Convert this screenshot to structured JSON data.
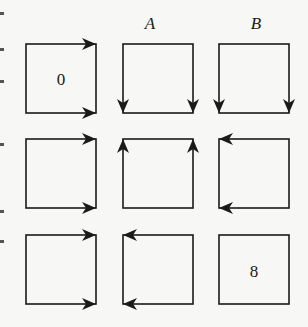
{
  "column_labels": [
    "",
    "A",
    "B"
  ],
  "stroke_color": "#1a1a1a",
  "background_color": "#f7f7f5",
  "grid": {
    "rows": 3,
    "cols": 3,
    "cells": [
      {
        "row": 0,
        "col": 0,
        "label": "0",
        "arrows": [
          {
            "corner": "top-right",
            "direction": "right"
          },
          {
            "corner": "bottom-right",
            "direction": "right"
          }
        ]
      },
      {
        "row": 0,
        "col": 1,
        "label": "",
        "arrows": [
          {
            "corner": "bottom-left",
            "direction": "down"
          },
          {
            "corner": "bottom-right",
            "direction": "down"
          }
        ]
      },
      {
        "row": 0,
        "col": 2,
        "label": "",
        "arrows": [
          {
            "corner": "bottom-left",
            "direction": "down"
          },
          {
            "corner": "bottom-right",
            "direction": "down"
          }
        ]
      },
      {
        "row": 1,
        "col": 0,
        "label": "",
        "arrows": [
          {
            "corner": "top-right",
            "direction": "right"
          },
          {
            "corner": "bottom-right",
            "direction": "right"
          }
        ]
      },
      {
        "row": 1,
        "col": 1,
        "label": "",
        "arrows": [
          {
            "corner": "top-left",
            "direction": "up"
          },
          {
            "corner": "top-right",
            "direction": "up"
          }
        ]
      },
      {
        "row": 1,
        "col": 2,
        "label": "",
        "arrows": [
          {
            "corner": "top-left",
            "direction": "left"
          },
          {
            "corner": "bottom-left",
            "direction": "left"
          }
        ]
      },
      {
        "row": 2,
        "col": 0,
        "label": "",
        "arrows": [
          {
            "corner": "top-right",
            "direction": "right"
          },
          {
            "corner": "bottom-right",
            "direction": "right"
          }
        ]
      },
      {
        "row": 2,
        "col": 1,
        "label": "",
        "arrows": [
          {
            "corner": "top-left",
            "direction": "left"
          },
          {
            "corner": "bottom-left",
            "direction": "left"
          }
        ]
      },
      {
        "row": 2,
        "col": 2,
        "label": "8",
        "arrows": []
      }
    ]
  },
  "labels": {
    "col_a": "A",
    "col_b": "B",
    "start_cell": "0",
    "end_cell": "8"
  }
}
